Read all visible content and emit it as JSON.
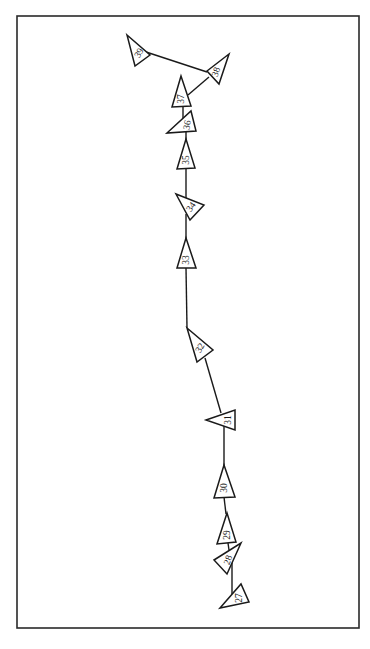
{
  "frame": {
    "x": 17,
    "y": 16,
    "width": 342,
    "height": 612
  },
  "colors": {
    "ink": "#1a1a1a",
    "background": "#ffffff"
  },
  "links": [
    {
      "from": "39",
      "to": "38",
      "x1": 140,
      "y1": 50,
      "x2": 207,
      "y2": 72
    },
    {
      "from": "38",
      "to": "37",
      "x1": 209,
      "y1": 77,
      "x2": 188,
      "y2": 95
    },
    {
      "from": "37",
      "to": "36",
      "x1": 183,
      "y1": 106,
      "x2": 183,
      "y2": 124
    },
    {
      "from": "36",
      "to": "35",
      "x1": 186,
      "y1": 131,
      "x2": 186,
      "y2": 140
    },
    {
      "from": "35",
      "to": "34",
      "x1": 186,
      "y1": 168,
      "x2": 186,
      "y2": 198
    },
    {
      "from": "34",
      "to": "33",
      "x1": 186,
      "y1": 214,
      "x2": 186,
      "y2": 240
    },
    {
      "from": "33",
      "to": "32",
      "x1": 186,
      "y1": 268,
      "x2": 187,
      "y2": 328
    },
    {
      "from": "32",
      "to": "31",
      "x1": 205,
      "y1": 358,
      "x2": 221,
      "y2": 413
    },
    {
      "from": "31",
      "to": "30",
      "x1": 224,
      "y1": 425,
      "x2": 224,
      "y2": 466
    },
    {
      "from": "30",
      "to": "29",
      "x1": 224,
      "y1": 497,
      "x2": 226,
      "y2": 514
    },
    {
      "from": "29",
      "to": "28",
      "x1": 228,
      "y1": 543,
      "x2": 229,
      "y2": 550
    },
    {
      "from": "28",
      "to": "27",
      "x1": 232,
      "y1": 558,
      "x2": 232,
      "y2": 594
    }
  ],
  "nodes": [
    {
      "id": "27",
      "label": "27",
      "points": "220,608 241,584 249,602",
      "cx": 239,
      "cy": 598,
      "rotate": -90
    },
    {
      "id": "28",
      "label": "28",
      "points": "214,560 241,543 227,574",
      "cx": 228,
      "cy": 560,
      "rotate": -70
    },
    {
      "id": "29",
      "label": "29",
      "points": "227,513 217,544 236,542",
      "cx": 227,
      "cy": 535,
      "rotate": -90
    },
    {
      "id": "30",
      "label": "30",
      "points": "224,465 214,498 235,497",
      "cx": 224,
      "cy": 488,
      "rotate": -90
    },
    {
      "id": "31",
      "label": "31",
      "points": "206,420 235,410 235,430",
      "cx": 228,
      "cy": 420,
      "rotate": -90
    },
    {
      "id": "32",
      "label": "32",
      "points": "187,328 213,350 197,362",
      "cx": 200,
      "cy": 348,
      "rotate": -60
    },
    {
      "id": "33",
      "label": "33",
      "points": "186,238 177,268 196,268",
      "cx": 186,
      "cy": 260,
      "rotate": -90
    },
    {
      "id": "34",
      "label": "34",
      "points": "176,194 204,205 190,220",
      "cx": 191,
      "cy": 207,
      "rotate": -55
    },
    {
      "id": "35",
      "label": "35",
      "points": "186,139 177,169 195,168",
      "cx": 186,
      "cy": 160,
      "rotate": -90
    },
    {
      "id": "36",
      "label": "36",
      "points": "167,133 191,111 196,131",
      "cx": 187,
      "cy": 125,
      "rotate": -80
    },
    {
      "id": "37",
      "label": "37",
      "points": "181,76 172,107 191,106",
      "cx": 181,
      "cy": 99,
      "rotate": -90
    },
    {
      "id": "38",
      "label": "38",
      "points": "207,71 229,54 219,84",
      "cx": 216,
      "cy": 72,
      "rotate": -70
    },
    {
      "id": "39",
      "label": "39",
      "points": "127,35 150,55 135,66",
      "cx": 139,
      "cy": 53,
      "rotate": -60
    }
  ]
}
